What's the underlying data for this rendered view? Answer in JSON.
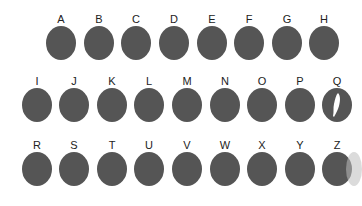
{
  "rows": [
    {
      "keys": [
        {
          "label": "A"
        },
        {
          "label": "B"
        },
        {
          "label": "C"
        },
        {
          "label": "D"
        },
        {
          "label": "E"
        },
        {
          "label": "F"
        },
        {
          "label": "G"
        },
        {
          "label": "H"
        }
      ]
    },
    {
      "keys": [
        {
          "label": "I"
        },
        {
          "label": "J"
        },
        {
          "label": "K"
        },
        {
          "label": "L"
        },
        {
          "label": "M"
        },
        {
          "label": "N"
        },
        {
          "label": "O"
        },
        {
          "label": "P"
        },
        {
          "label": "Q",
          "icon": "feather-icon"
        }
      ]
    },
    {
      "keys": [
        {
          "label": "R"
        },
        {
          "label": "S"
        },
        {
          "label": "T"
        },
        {
          "label": "U"
        },
        {
          "label": "V"
        },
        {
          "label": "W"
        },
        {
          "label": "X"
        },
        {
          "label": "Y"
        },
        {
          "label": "Z"
        }
      ]
    }
  ],
  "colors": {
    "key": "#555555",
    "label": "#222222",
    "background": "#ffffff"
  }
}
